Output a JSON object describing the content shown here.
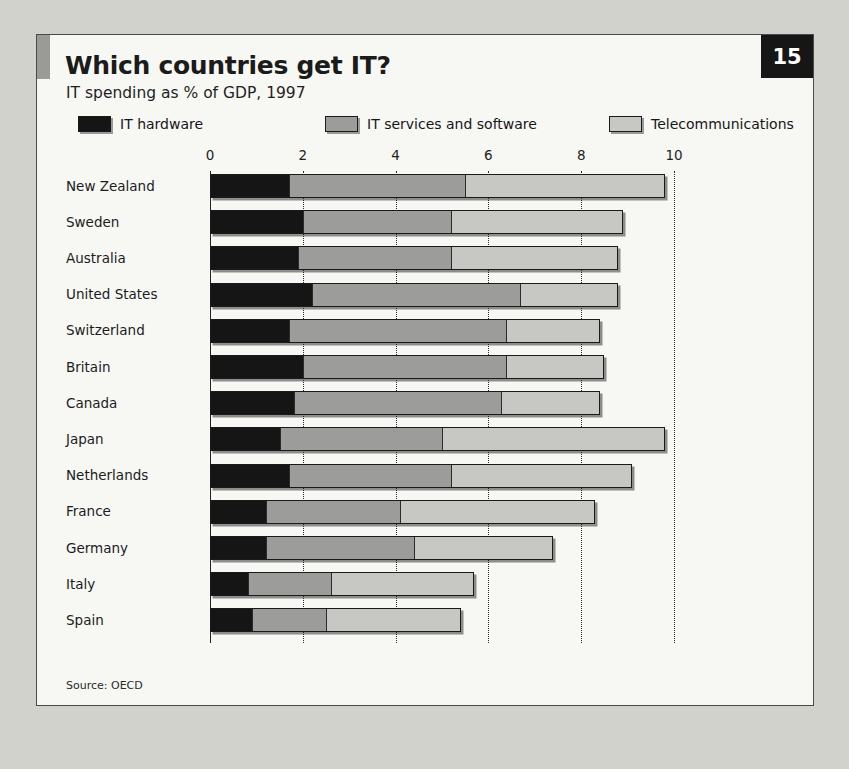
{
  "panel": {
    "page_number": "15",
    "title": "Which countries get IT?",
    "subtitle": "IT spending as % of GDP, 1997",
    "source": "Source: OECD"
  },
  "legend": [
    {
      "label": "IT hardware",
      "color": "#151515",
      "key": "hardware"
    },
    {
      "label": "IT services and software",
      "color": "#9c9c9a",
      "key": "services"
    },
    {
      "label": "Telecommunications",
      "color": "#c7c7c4",
      "key": "telecom"
    }
  ],
  "chart_data": {
    "type": "bar",
    "orientation": "horizontal",
    "stacked": true,
    "title": "Which countries get IT?",
    "subtitle": "IT spending as % of GDP, 1997",
    "xlabel": "",
    "ylabel": "",
    "xlim": [
      0,
      10
    ],
    "xticks": [
      0,
      2,
      4,
      6,
      8,
      10
    ],
    "xtick_labels": [
      "0",
      "2",
      "4",
      "6",
      "8",
      "10"
    ],
    "grid": "vertical-dotted",
    "legend_position": "top",
    "source": "Source: OECD",
    "categories": [
      "New Zealand",
      "Sweden",
      "Australia",
      "United States",
      "Switzerland",
      "Britain",
      "Canada",
      "Japan",
      "Netherlands",
      "France",
      "Germany",
      "Italy",
      "Spain"
    ],
    "series": [
      {
        "name": "IT hardware",
        "color": "#151515",
        "values": [
          1.7,
          2.0,
          1.9,
          2.2,
          1.7,
          2.0,
          1.8,
          1.5,
          1.7,
          1.2,
          1.2,
          0.8,
          0.9
        ]
      },
      {
        "name": "IT services and software",
        "color": "#9c9c9a",
        "values": [
          3.8,
          3.2,
          3.3,
          4.5,
          4.7,
          4.4,
          4.5,
          3.5,
          3.5,
          2.9,
          3.2,
          1.8,
          1.6
        ]
      },
      {
        "name": "Telecommunications",
        "color": "#c7c7c4",
        "values": [
          4.3,
          3.7,
          3.6,
          2.1,
          2.0,
          2.1,
          2.1,
          4.8,
          3.9,
          4.2,
          3.0,
          3.1,
          2.9
        ]
      }
    ],
    "totals": [
      9.8,
      8.9,
      8.8,
      8.8,
      8.4,
      8.5,
      8.4,
      9.8,
      9.1,
      8.3,
      7.4,
      5.7,
      5.4
    ]
  }
}
